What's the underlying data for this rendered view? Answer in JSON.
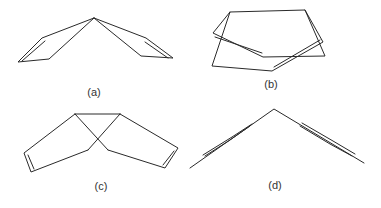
{
  "figure": {
    "panels": [
      {
        "id": "a",
        "label": "(a)",
        "label_pos": [
          94,
          87
        ]
      },
      {
        "id": "b",
        "label": "(b)",
        "label_pos": [
          271,
          79
        ]
      },
      {
        "id": "c",
        "label": "(c)",
        "label_pos": [
          101,
          181
        ]
      },
      {
        "id": "d",
        "label": "(d)",
        "label_pos": [
          275,
          180
        ]
      }
    ],
    "colors": {
      "stroke": "#2a2a2a",
      "background": "#ffffff",
      "label": "#333333"
    }
  }
}
